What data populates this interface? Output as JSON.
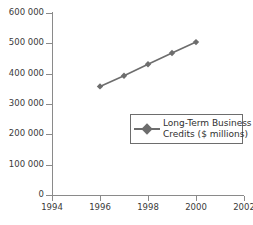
{
  "chart_data": {
    "type": "line",
    "title": "",
    "xlabel": "",
    "ylabel": "",
    "x": [
      1996,
      1997,
      1998,
      1999,
      2000
    ],
    "series": [
      {
        "name": "Long-Term Business Credits ($ millions)",
        "values": [
          358000,
          393000,
          431000,
          468000,
          504000
        ]
      }
    ],
    "xlim": [
      1994,
      2002
    ],
    "ylim": [
      0,
      600000
    ],
    "xticks": [
      1994,
      1996,
      1998,
      2000,
      2002
    ],
    "yticks": [
      0,
      100000,
      200000,
      300000,
      400000,
      500000,
      600000
    ],
    "xtick_labels": [
      "1994",
      "1996",
      "1998",
      "2000",
      "2002"
    ],
    "ytick_labels": [
      "0",
      "100 000",
      "200 000",
      "300 000",
      "400 000",
      "500 000",
      "600 000"
    ],
    "grid": false,
    "legend_position": "center-right",
    "legend_lines": [
      "Long-Term Business",
      "Credits ($ millions)"
    ],
    "colors": {
      "series": "#6d6d6d",
      "axis": "#8a8a8a",
      "text": "#333333",
      "legend_border": "#6d6d6d",
      "background": "#ffffff"
    },
    "marker": "diamond"
  }
}
